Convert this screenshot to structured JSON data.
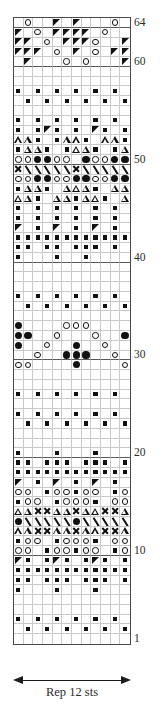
{
  "chart_data": {
    "type": "table",
    "stitches": 12,
    "rows": 64,
    "repeat_label": "Rep 12 sts",
    "row_number_labels": [
      "64",
      "60",
      "50",
      "40",
      "30",
      "20",
      "10",
      "1"
    ],
    "legend_symbols": {
      "oc": "open-circle-yarn-over",
      "fc": "filled-circle-bobble",
      "sq": "small-filled-square-purl",
      "tl": "filled-triangle-left-decrease",
      "tr": "filled-triangle-right-decrease",
      "ot": "open-triangle",
      "x": "cross-stitch-x",
      "sl": "right-slant-line",
      "bsl": "left-slant-line",
      "e": "empty-knit"
    },
    "grid": [
      {
        "r": 64,
        "c": [
          "e",
          "oc",
          "e",
          "e",
          "tl",
          "e",
          "tl",
          "e",
          "e",
          "e",
          "oc",
          "e"
        ]
      },
      {
        "r": 63,
        "c": [
          "tl",
          "e",
          "oc",
          "e",
          "tl",
          "tl",
          "tl",
          "tl",
          "e",
          "oc",
          "e",
          "e"
        ]
      },
      {
        "r": 62,
        "c": [
          "tl",
          "tl",
          "e",
          "oc",
          "e",
          "tl",
          "tl",
          "tl",
          "oc",
          "e",
          "e",
          "tl"
        ]
      },
      {
        "r": 61,
        "c": [
          "tl",
          "tl",
          "tl",
          "e",
          "oc",
          "e",
          "tl",
          "e",
          "oc",
          "e",
          "tl",
          "tl"
        ]
      },
      {
        "r": 60,
        "c": [
          "e",
          "tl",
          "e",
          "e",
          "e",
          "oc",
          "e",
          "oc",
          "e",
          "e",
          "e",
          "tl"
        ]
      },
      {
        "r": 59,
        "c": [
          "e",
          "e",
          "e",
          "e",
          "e",
          "e",
          "e",
          "e",
          "e",
          "e",
          "e",
          "e"
        ]
      },
      {
        "r": 58,
        "c": [
          "e",
          "e",
          "e",
          "e",
          "e",
          "e",
          "e",
          "e",
          "e",
          "e",
          "e",
          "e"
        ]
      },
      {
        "r": 57,
        "c": [
          "sq",
          "e",
          "sq",
          "e",
          "sq",
          "e",
          "sq",
          "e",
          "sq",
          "e",
          "sq",
          "e"
        ]
      },
      {
        "r": 56,
        "c": [
          "e",
          "sq",
          "e",
          "sq",
          "e",
          "sq",
          "e",
          "sq",
          "e",
          "sq",
          "e",
          "sq"
        ]
      },
      {
        "r": 55,
        "c": [
          "e",
          "e",
          "e",
          "e",
          "e",
          "e",
          "e",
          "e",
          "e",
          "e",
          "e",
          "e"
        ]
      },
      {
        "r": 54,
        "c": [
          "sq",
          "e",
          "sq",
          "e",
          "sq",
          "e",
          "sq",
          "e",
          "sq",
          "e",
          "sq",
          "e"
        ]
      },
      {
        "r": 53,
        "c": [
          "sq",
          "e",
          "sq",
          "tl",
          "sq",
          "e",
          "sq",
          "e",
          "tl",
          "sq",
          "e",
          "sq"
        ]
      },
      {
        "r": 52,
        "c": [
          "ot",
          "ot",
          "sq",
          "e",
          "sq",
          "ot",
          "ot",
          "sq",
          "e",
          "ot",
          "ot",
          "sq"
        ]
      },
      {
        "r": 51,
        "c": [
          "sq",
          "ot",
          "ot",
          "sq",
          "e",
          "sq",
          "ot",
          "ot",
          "sq",
          "e",
          "sq",
          "ot"
        ]
      },
      {
        "r": 50,
        "c": [
          "oc",
          "oc",
          "fc",
          "fc",
          "oc",
          "oc",
          "e",
          "fc",
          "oc",
          "oc",
          "fc",
          "fc"
        ]
      },
      {
        "r": 49,
        "c": [
          "x",
          "sl",
          "sl",
          "sl",
          "sl",
          "sl",
          "x",
          "sl",
          "sl",
          "sl",
          "sl",
          "sl"
        ]
      },
      {
        "r": 48,
        "c": [
          "oc",
          "oc",
          "fc",
          "fc",
          "oc",
          "oc",
          "fc",
          "fc",
          "oc",
          "oc",
          "fc",
          "fc"
        ]
      },
      {
        "r": 47,
        "c": [
          "sq",
          "ot",
          "ot",
          "sq",
          "e",
          "ot",
          "ot",
          "ot",
          "sq",
          "e",
          "ot",
          "ot"
        ]
      },
      {
        "r": 46,
        "c": [
          "ot",
          "ot",
          "sq",
          "e",
          "ot",
          "ot",
          "sq",
          "ot",
          "ot",
          "sq",
          "e",
          "ot"
        ]
      },
      {
        "r": 45,
        "c": [
          "sq",
          "e",
          "sq",
          "e",
          "sq",
          "e",
          "sq",
          "e",
          "sq",
          "e",
          "sq",
          "e"
        ]
      },
      {
        "r": 44,
        "c": [
          "sq",
          "e",
          "sq",
          "e",
          "sq",
          "e",
          "sq",
          "e",
          "sq",
          "e",
          "sq",
          "e"
        ]
      },
      {
        "r": 43,
        "c": [
          "tl",
          "e",
          "sq",
          "e",
          "tl",
          "e",
          "sq",
          "e",
          "tl",
          "e",
          "sq",
          "e"
        ]
      },
      {
        "r": 42,
        "c": [
          "sq",
          "sq",
          "sq",
          "sq",
          "sq",
          "sq",
          "sq",
          "sq",
          "sq",
          "sq",
          "sq",
          "sq"
        ]
      },
      {
        "r": 41,
        "c": [
          "sq",
          "sq",
          "e",
          "sq",
          "sq",
          "e",
          "sq",
          "sq",
          "sq",
          "e",
          "sq",
          "e"
        ]
      },
      {
        "r": 40,
        "c": [
          "sq",
          "e",
          "e",
          "e",
          "sq",
          "e",
          "e",
          "sq",
          "e",
          "e",
          "e",
          "e"
        ]
      },
      {
        "r": 39,
        "c": [
          "e",
          "e",
          "e",
          "e",
          "e",
          "e",
          "e",
          "e",
          "e",
          "e",
          "e",
          "e"
        ]
      },
      {
        "r": 38,
        "c": [
          "e",
          "e",
          "e",
          "e",
          "e",
          "e",
          "e",
          "e",
          "e",
          "e",
          "e",
          "e"
        ]
      },
      {
        "r": 37,
        "c": [
          "e",
          "e",
          "e",
          "e",
          "e",
          "e",
          "e",
          "e",
          "e",
          "e",
          "e",
          "e"
        ]
      },
      {
        "r": 36,
        "c": [
          "sq",
          "e",
          "sq",
          "e",
          "sq",
          "e",
          "sq",
          "e",
          "sq",
          "e",
          "sq",
          "e"
        ]
      },
      {
        "r": 35,
        "c": [
          "e",
          "sq",
          "e",
          "sq",
          "e",
          "sq",
          "e",
          "sq",
          "e",
          "sq",
          "e",
          "sq"
        ]
      },
      {
        "r": 34,
        "c": [
          "e",
          "e",
          "e",
          "e",
          "e",
          "e",
          "e",
          "e",
          "e",
          "e",
          "e",
          "e"
        ]
      },
      {
        "r": 33,
        "c": [
          "fc",
          "e",
          "e",
          "e",
          "e",
          "oc",
          "oc",
          "oc",
          "e",
          "e",
          "e",
          "e"
        ]
      },
      {
        "r": 32,
        "c": [
          "fc",
          "fc",
          "e",
          "e",
          "oc",
          "e",
          "e",
          "e",
          "oc",
          "e",
          "e",
          "fc"
        ]
      },
      {
        "r": 31,
        "c": [
          "fc",
          "e",
          "e",
          "oc",
          "e",
          "e",
          "fc",
          "e",
          "e",
          "oc",
          "e",
          "e"
        ]
      },
      {
        "r": 30,
        "c": [
          "e",
          "e",
          "oc",
          "e",
          "e",
          "fc",
          "fc",
          "fc",
          "e",
          "e",
          "oc",
          "e"
        ]
      },
      {
        "r": 29,
        "c": [
          "oc",
          "oc",
          "e",
          "e",
          "e",
          "e",
          "fc",
          "e",
          "e",
          "e",
          "e",
          "oc"
        ]
      },
      {
        "r": 28,
        "c": [
          "e",
          "e",
          "e",
          "e",
          "e",
          "e",
          "e",
          "e",
          "e",
          "e",
          "e",
          "e"
        ]
      },
      {
        "r": 27,
        "c": [
          "e",
          "e",
          "e",
          "e",
          "e",
          "e",
          "e",
          "e",
          "e",
          "e",
          "e",
          "e"
        ]
      },
      {
        "r": 26,
        "c": [
          "sq",
          "e",
          "sq",
          "e",
          "sq",
          "e",
          "sq",
          "e",
          "sq",
          "e",
          "sq",
          "e"
        ]
      },
      {
        "r": 25,
        "c": [
          "e",
          "e",
          "e",
          "e",
          "e",
          "e",
          "e",
          "e",
          "e",
          "e",
          "e",
          "e"
        ]
      },
      {
        "r": 24,
        "c": [
          "sq",
          "e",
          "sq",
          "e",
          "sq",
          "e",
          "sq",
          "e",
          "sq",
          "e",
          "sq",
          "e"
        ]
      },
      {
        "r": 23,
        "c": [
          "e",
          "sq",
          "e",
          "sq",
          "e",
          "sq",
          "e",
          "sq",
          "e",
          "sq",
          "e",
          "sq"
        ]
      },
      {
        "r": 22,
        "c": [
          "e",
          "e",
          "e",
          "e",
          "e",
          "e",
          "e",
          "e",
          "e",
          "e",
          "e",
          "e"
        ]
      },
      {
        "r": 21,
        "c": [
          "e",
          "e",
          "e",
          "e",
          "e",
          "e",
          "e",
          "e",
          "e",
          "e",
          "e",
          "e"
        ]
      },
      {
        "r": 20,
        "c": [
          "sq",
          "e",
          "e",
          "e",
          "sq",
          "e",
          "e",
          "e",
          "sq",
          "e",
          "e",
          "e"
        ]
      },
      {
        "r": 19,
        "c": [
          "sq",
          "sq",
          "e",
          "sq",
          "sq",
          "sq",
          "e",
          "sq",
          "sq",
          "sq",
          "e",
          "sq"
        ]
      },
      {
        "r": 18,
        "c": [
          "sq",
          "sq",
          "sq",
          "sq",
          "sq",
          "sq",
          "sq",
          "sq",
          "sq",
          "sq",
          "sq",
          "sq"
        ]
      },
      {
        "r": 17,
        "c": [
          "tl",
          "e",
          "sq",
          "e",
          "tl",
          "e",
          "sq",
          "e",
          "tl",
          "e",
          "sq",
          "e"
        ]
      },
      {
        "r": 16,
        "c": [
          "oc",
          "oc",
          "e",
          "sq",
          "oc",
          "oc",
          "sq",
          "oc",
          "oc",
          "e",
          "sq",
          "oc"
        ]
      },
      {
        "r": 15,
        "c": [
          "sq",
          "oc",
          "oc",
          "e",
          "sq",
          "oc",
          "oc",
          "oc",
          "sq",
          "e",
          "oc",
          "oc"
        ]
      },
      {
        "r": 14,
        "c": [
          "ot",
          "ot",
          "x",
          "x",
          "ot",
          "ot",
          "x",
          "ot",
          "ot",
          "x",
          "x",
          "ot"
        ]
      },
      {
        "r": 13,
        "c": [
          "fc",
          "sl",
          "sl",
          "sl",
          "sl",
          "sl",
          "fc",
          "sl",
          "sl",
          "sl",
          "sl",
          "sl"
        ]
      },
      {
        "r": 12,
        "c": [
          "ot",
          "ot",
          "x",
          "x",
          "ot",
          "ot",
          "x",
          "ot",
          "ot",
          "x",
          "x",
          "ot"
        ]
      },
      {
        "r": 11,
        "c": [
          "sq",
          "oc",
          "oc",
          "e",
          "sq",
          "oc",
          "oc",
          "oc",
          "sq",
          "e",
          "oc",
          "oc"
        ]
      },
      {
        "r": 10,
        "c": [
          "oc",
          "oc",
          "e",
          "sq",
          "oc",
          "oc",
          "sq",
          "oc",
          "oc",
          "e",
          "sq",
          "oc"
        ]
      },
      {
        "r": 9,
        "c": [
          "tl",
          "sq",
          "e",
          "sq",
          "tl",
          "sq",
          "e",
          "sq",
          "tl",
          "sq",
          "e",
          "sq"
        ]
      },
      {
        "r": 8,
        "c": [
          "sq",
          "sq",
          "sq",
          "sq",
          "sq",
          "sq",
          "sq",
          "sq",
          "sq",
          "sq",
          "sq",
          "sq"
        ]
      },
      {
        "r": 7,
        "c": [
          "sq",
          "sq",
          "e",
          "sq",
          "sq",
          "sq",
          "e",
          "sq",
          "sq",
          "sq",
          "e",
          "sq"
        ]
      },
      {
        "r": 6,
        "c": [
          "sq",
          "e",
          "e",
          "e",
          "sq",
          "e",
          "e",
          "e",
          "sq",
          "e",
          "e",
          "e"
        ]
      },
      {
        "r": 5,
        "c": [
          "e",
          "e",
          "e",
          "e",
          "e",
          "e",
          "e",
          "e",
          "e",
          "e",
          "e",
          "e"
        ]
      },
      {
        "r": 4,
        "c": [
          "e",
          "e",
          "e",
          "e",
          "e",
          "e",
          "e",
          "e",
          "e",
          "e",
          "e",
          "e"
        ]
      },
      {
        "r": 3,
        "c": [
          "sq",
          "e",
          "sq",
          "e",
          "sq",
          "e",
          "sq",
          "e",
          "sq",
          "e",
          "sq",
          "e"
        ]
      },
      {
        "r": 2,
        "c": [
          "e",
          "sq",
          "e",
          "sq",
          "e",
          "sq",
          "e",
          "sq",
          "e",
          "sq",
          "e",
          "sq"
        ]
      },
      {
        "r": 1,
        "c": [
          "e",
          "e",
          "e",
          "e",
          "e",
          "e",
          "e",
          "e",
          "e",
          "e",
          "e",
          "e"
        ]
      }
    ]
  }
}
